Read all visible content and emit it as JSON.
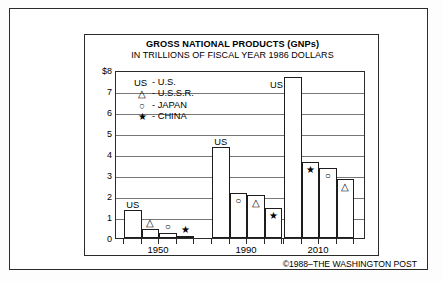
{
  "chart_data": {
    "type": "bar",
    "title": "GROSS NATIONAL PRODUCTS (GNPs)",
    "subtitle": "IN TRILLIONS OF FISCAL YEAR 1986 DOLLARS",
    "xlabel": "",
    "ylabel": "",
    "ylim": [
      0,
      8
    ],
    "grid": true,
    "legend_position": "inside-top-left",
    "ytick_labels": [
      "$8",
      "7",
      "6",
      "5",
      "4",
      "3",
      "2",
      "1",
      "0"
    ],
    "ytick_values": [
      8,
      7,
      6,
      5,
      4,
      3,
      2,
      1,
      0
    ],
    "categories": [
      "1950",
      "1990",
      "2010"
    ],
    "series": [
      {
        "name": "U.S.",
        "symbol": "US",
        "values": [
          1.35,
          4.35,
          7.65
        ]
      },
      {
        "name": "U.S.S.R.",
        "symbol": "triangle",
        "values": [
          0.45,
          2.05,
          2.8
        ]
      },
      {
        "name": "JAPAN",
        "symbol": "circle",
        "values": [
          0.25,
          2.15,
          3.35
        ]
      },
      {
        "name": "CHINA",
        "symbol": "star",
        "values": [
          0.1,
          1.45,
          3.6
        ]
      }
    ],
    "groups": [
      {
        "label": "1950",
        "bars": [
          {
            "country": "U.S.",
            "value": 1.35,
            "marker": "",
            "value_label": "US",
            "filled": false
          },
          {
            "country": "U.S.S.R.",
            "value": 0.45,
            "marker": "△",
            "value_label": "",
            "filled": false
          },
          {
            "country": "JAPAN",
            "value": 0.25,
            "marker": "○",
            "value_label": "",
            "filled": false
          },
          {
            "country": "CHINA",
            "value": 0.1,
            "marker": "★",
            "value_label": "",
            "filled": true
          }
        ]
      },
      {
        "label": "1990",
        "bars": [
          {
            "country": "U.S.",
            "value": 4.35,
            "marker": "",
            "value_label": "US",
            "filled": false
          },
          {
            "country": "JAPAN",
            "value": 2.15,
            "marker": "○",
            "value_label": "",
            "filled": false
          },
          {
            "country": "U.S.S.R.",
            "value": 2.05,
            "marker": "△",
            "value_label": "",
            "filled": false
          },
          {
            "country": "CHINA",
            "value": 1.45,
            "marker": "★",
            "value_label": "",
            "filled": false
          }
        ]
      },
      {
        "label": "2010",
        "bars": [
          {
            "country": "U.S.",
            "value": 7.65,
            "marker": "",
            "value_label": "US",
            "filled": false
          },
          {
            "country": "CHINA",
            "value": 3.6,
            "marker": "★",
            "value_label": "",
            "filled": false
          },
          {
            "country": "JAPAN",
            "value": 3.35,
            "marker": "○",
            "value_label": "",
            "filled": false
          },
          {
            "country": "U.S.S.R.",
            "value": 2.8,
            "marker": "△",
            "value_label": "",
            "filled": false
          }
        ]
      }
    ],
    "legend": [
      {
        "symbol": "US",
        "label": "- U.S."
      },
      {
        "symbol": "△",
        "label": "- U.S.S.R."
      },
      {
        "symbol": "○",
        "label": "- JAPAN"
      },
      {
        "symbol": "★",
        "label": "- CHINA"
      }
    ],
    "annotations": [
      "US",
      "US",
      "US"
    ]
  },
  "credit": "©1988–THE WASHINGTON POST"
}
